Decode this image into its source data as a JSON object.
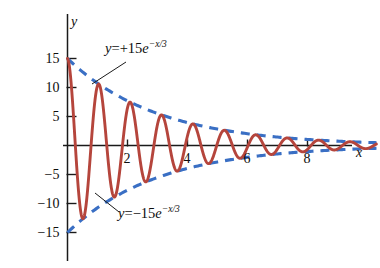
{
  "chart_data": {
    "type": "line",
    "title": "",
    "xlabel": "x",
    "ylabel": "y",
    "xlim": [
      -0.35,
      10.4
    ],
    "ylim": [
      -16.6,
      17.2
    ],
    "grid": false,
    "legend": false,
    "xticks": [
      2,
      4,
      6,
      8
    ],
    "xtick_labels": [
      "2",
      "4",
      "6",
      "8"
    ],
    "yticks": [
      15,
      10,
      5,
      -5,
      -10,
      -15
    ],
    "ytick_labels": [
      "15",
      "10",
      "5",
      "−5",
      "−10",
      "−15"
    ],
    "series": [
      {
        "name": "damped oscillation",
        "kind": "solid",
        "color": "#b5453c",
        "formula": "y = 15e^(-x/3) cos(6x)",
        "amplitude": 15,
        "decay_constant": 3,
        "angular_frequency": 6,
        "x_start": 0,
        "x_end": 10.3
      },
      {
        "name": "upper envelope",
        "kind": "dashed",
        "color": "#3a6fc4",
        "formula": "y = +15e^(-x/3)",
        "amplitude": 15,
        "decay_constant": 3,
        "x_start": 0,
        "x_end": 10.3
      },
      {
        "name": "lower envelope",
        "kind": "dashed",
        "color": "#3a6fc4",
        "formula": "y = -15e^(-x/3)",
        "amplitude": -15,
        "decay_constant": 3,
        "x_start": 0,
        "x_end": 10.3
      }
    ],
    "annotations": [
      {
        "name": "upper-envelope-label",
        "text": "y = +15e^(−x/3)",
        "lhs": "y",
        "eq": "=",
        "sign": "+",
        "coefficient": "15",
        "base": "e",
        "exponent": "−x/3",
        "points_to": "upper envelope"
      },
      {
        "name": "lower-envelope-label",
        "text": "y = −15e^(−x/3)",
        "lhs": "y",
        "eq": "=",
        "sign": "−",
        "coefficient": "15",
        "base": "e",
        "exponent": "−x/3",
        "points_to": "lower envelope"
      }
    ],
    "colors": {
      "curve": "#b5453c",
      "envelope": "#3a6fc4",
      "axis": "#1a1a1a",
      "text": "#0d0d0d",
      "background": "#ffffff"
    }
  }
}
